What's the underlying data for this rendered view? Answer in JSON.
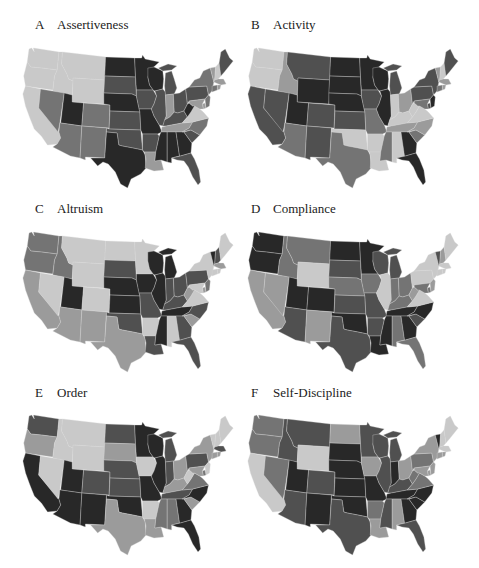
{
  "figure": {
    "panels": [
      {
        "id": "A",
        "letter": "A",
        "title": "Assertiveness"
      },
      {
        "id": "B",
        "letter": "B",
        "title": "Activity"
      },
      {
        "id": "C",
        "letter": "C",
        "title": "Altruism"
      },
      {
        "id": "D",
        "letter": "D",
        "title": "Compliance"
      },
      {
        "id": "E",
        "letter": "E",
        "title": "Order"
      },
      {
        "id": "F",
        "letter": "F",
        "title": "Self-Discipline"
      }
    ]
  },
  "shade_palette": {
    "1": "#c9c9c9",
    "2": "#9b9b9b",
    "3": "#747474",
    "4": "#505050",
    "5": "#282828"
  },
  "chart_data": [
    {
      "type": "choropleth",
      "title": "Assertiveness",
      "panel": "A",
      "scale": "grayscale 1 (low, light) to 5 (high, dark)",
      "values": {
        "WA": 1,
        "OR": 1,
        "CA": 1,
        "ID": 1,
        "NV": 3,
        "MT": 1,
        "WY": 1,
        "UT": 5,
        "CO": 3,
        "AZ": 3,
        "NM": 3,
        "ND": 5,
        "SD": 4,
        "NE": 5,
        "KS": 4,
        "OK": 4,
        "TX": 5,
        "MN": 5,
        "IA": 4,
        "MO": 5,
        "AR": 4,
        "LA": 2,
        "WI": 5,
        "IL": 4,
        "MI": 4,
        "IN": 2,
        "OH": 4,
        "KY": 4,
        "TN": 2,
        "MS": 5,
        "AL": 5,
        "GA": 5,
        "FL": 4,
        "SC": 4,
        "NC": 3,
        "VA": 1,
        "WV": 5,
        "PA": 4,
        "NY": 3,
        "VT": 2,
        "NH": 1,
        "ME": 4,
        "MA": 2,
        "CT": 3,
        "RI": 2,
        "NJ": 3,
        "DE": 2,
        "MD": 2
      }
    },
    {
      "type": "choropleth",
      "title": "Activity",
      "panel": "B",
      "scale": "grayscale 1 (low, light) to 5 (high, dark)",
      "values": {
        "WA": 1,
        "OR": 1,
        "CA": 4,
        "ID": 2,
        "NV": 4,
        "MT": 4,
        "WY": 5,
        "UT": 5,
        "CO": 4,
        "AZ": 3,
        "NM": 4,
        "ND": 5,
        "SD": 5,
        "NE": 5,
        "KS": 4,
        "OK": 1,
        "TX": 3,
        "MN": 5,
        "IA": 4,
        "MO": 3,
        "AR": 1,
        "LA": 1,
        "WI": 5,
        "IL": 5,
        "MI": 4,
        "IN": 1,
        "OH": 2,
        "KY": 1,
        "TN": 2,
        "MS": 3,
        "AL": 1,
        "GA": 5,
        "FL": 5,
        "SC": 3,
        "NC": 2,
        "VA": 1,
        "WV": 1,
        "PA": 4,
        "NY": 4,
        "VT": 2,
        "NH": 1,
        "ME": 4,
        "MA": 2,
        "CT": 3,
        "RI": 2,
        "NJ": 5,
        "DE": 4,
        "MD": 3
      }
    },
    {
      "type": "choropleth",
      "title": "Altruism",
      "panel": "C",
      "scale": "grayscale 1 (low, light) to 5 (high, dark)",
      "values": {
        "WA": 3,
        "OR": 3,
        "CA": 2,
        "ID": 3,
        "NV": 1,
        "MT": 1,
        "WY": 1,
        "UT": 5,
        "CO": 1,
        "AZ": 2,
        "NM": 2,
        "ND": 1,
        "SD": 4,
        "NE": 5,
        "KS": 5,
        "OK": 4,
        "TX": 2,
        "MN": 1,
        "IA": 5,
        "MO": 4,
        "AR": 1,
        "LA": 4,
        "WI": 5,
        "IL": 5,
        "MI": 5,
        "IN": 4,
        "OH": 4,
        "KY": 4,
        "TN": 5,
        "MS": 5,
        "AL": 1,
        "GA": 4,
        "FL": 4,
        "SC": 2,
        "NC": 4,
        "VA": 1,
        "WV": 2,
        "PA": 4,
        "NY": 1,
        "VT": 5,
        "NH": 4,
        "ME": 1,
        "MA": 2,
        "CT": 1,
        "RI": 1,
        "NJ": 3,
        "DE": 2,
        "MD": 1
      }
    },
    {
      "type": "choropleth",
      "title": "Compliance",
      "panel": "D",
      "scale": "grayscale 1 (low, light) to 5 (high, dark)",
      "values": {
        "WA": 5,
        "OR": 5,
        "CA": 2,
        "ID": 3,
        "NV": 2,
        "MT": 3,
        "WY": 1,
        "UT": 5,
        "CO": 5,
        "AZ": 4,
        "NM": 2,
        "ND": 5,
        "SD": 4,
        "NE": 3,
        "KS": 4,
        "OK": 5,
        "TX": 4,
        "MN": 5,
        "IA": 3,
        "MO": 4,
        "AR": 4,
        "LA": 5,
        "WI": 4,
        "IL": 1,
        "MI": 4,
        "IN": 3,
        "OH": 3,
        "KY": 3,
        "TN": 5,
        "MS": 5,
        "AL": 3,
        "GA": 5,
        "FL": 3,
        "SC": 4,
        "NC": 5,
        "VA": 1,
        "WV": 2,
        "PA": 1,
        "NY": 1,
        "VT": 4,
        "NH": 2,
        "ME": 1,
        "MA": 1,
        "CT": 1,
        "RI": 1,
        "NJ": 2,
        "DE": 3,
        "MD": 3
      }
    },
    {
      "type": "choropleth",
      "title": "Order",
      "panel": "E",
      "scale": "grayscale 1 (low, light) to 5 (high, dark)",
      "values": {
        "WA": 4,
        "OR": 2,
        "CA": 5,
        "ID": 1,
        "NV": 1,
        "MT": 1,
        "WY": 1,
        "UT": 5,
        "CO": 4,
        "AZ": 5,
        "NM": 5,
        "ND": 4,
        "SD": 2,
        "NE": 4,
        "KS": 4,
        "OK": 5,
        "TX": 2,
        "MN": 5,
        "IA": 1,
        "MO": 5,
        "AR": 1,
        "LA": 2,
        "WI": 5,
        "IL": 5,
        "MI": 4,
        "IN": 4,
        "OH": 2,
        "KY": 2,
        "TN": 4,
        "MS": 3,
        "AL": 3,
        "GA": 5,
        "FL": 5,
        "SC": 2,
        "NC": 5,
        "VA": 3,
        "WV": 1,
        "PA": 4,
        "NY": 2,
        "VT": 1,
        "NH": 1,
        "ME": 1,
        "MA": 4,
        "CT": 2,
        "RI": 2,
        "NJ": 1,
        "DE": 3,
        "MD": 2
      }
    },
    {
      "type": "choropleth",
      "title": "Self-Discipline",
      "panel": "F",
      "scale": "grayscale 1 (low, light) to 5 (high, dark)",
      "values": {
        "WA": 3,
        "OR": 3,
        "CA": 1,
        "ID": 4,
        "NV": 3,
        "MT": 4,
        "WY": 1,
        "UT": 5,
        "CO": 4,
        "AZ": 4,
        "NM": 5,
        "ND": 2,
        "SD": 5,
        "NE": 5,
        "KS": 5,
        "OK": 5,
        "TX": 4,
        "MN": 4,
        "IA": 2,
        "MO": 5,
        "AR": 3,
        "LA": 2,
        "WI": 4,
        "IL": 4,
        "MI": 4,
        "IN": 5,
        "OH": 2,
        "KY": 4,
        "TN": 5,
        "MS": 4,
        "AL": 2,
        "GA": 5,
        "FL": 4,
        "SC": 5,
        "NC": 5,
        "VA": 3,
        "WV": 3,
        "PA": 3,
        "NY": 2,
        "VT": 5,
        "NH": 1,
        "ME": 1,
        "MA": 1,
        "CT": 2,
        "RI": 2,
        "NJ": 2,
        "DE": 2,
        "MD": 2
      }
    }
  ]
}
